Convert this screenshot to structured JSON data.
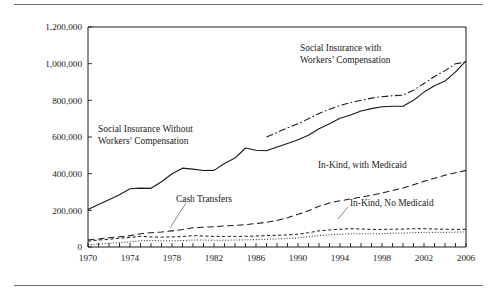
{
  "figure": {
    "has_top_rule": true,
    "has_bottom_rule": true
  },
  "axes": {
    "ylabel": "Dollars (Millions)",
    "xlabel": "Year",
    "ytick_labels": [
      "0",
      "200,000",
      "400,000",
      "600,000",
      "800,000",
      "1,000,000",
      "1,200,000"
    ],
    "xtick_labels": [
      "1970",
      "1974",
      "1978",
      "1982",
      "1986",
      "1990",
      "1994",
      "1998",
      "2002",
      "2006"
    ]
  },
  "annotations": {
    "social_with": "Social Insurance with\nWorkers’ Compensation",
    "social_with_line1": "Social Insurance with",
    "social_with_line2": "Workers’ Compensation",
    "social_without_line1": "Social Insurance Without",
    "social_without_line2": "Workers’ Compensation",
    "inkind_with": "In-Kind, with Medicaid",
    "inkind_no": "In-Kind, No Medicaid",
    "cash_transfers": "Cash Transfers"
  },
  "chart_data": {
    "type": "line",
    "title": "",
    "xlabel": "Year",
    "ylabel": "Dollars (Millions)",
    "xlim": [
      1970,
      2006
    ],
    "ylim": [
      0,
      1200000
    ],
    "ytick_values": [
      0,
      200000,
      400000,
      600000,
      800000,
      1000000,
      1200000
    ],
    "xtick_values": [
      1970,
      1974,
      1978,
      1982,
      1986,
      1990,
      1994,
      1998,
      2002,
      2006
    ],
    "minor_xticks_every": 1,
    "grid": false,
    "legend": "inline-annotations",
    "x": [
      1970,
      1971,
      1972,
      1973,
      1974,
      1975,
      1976,
      1977,
      1978,
      1979,
      1980,
      1981,
      1982,
      1983,
      1984,
      1985,
      1986,
      1987,
      1988,
      1989,
      1990,
      1991,
      1992,
      1993,
      1994,
      1995,
      1996,
      1997,
      1998,
      1999,
      2000,
      2001,
      2002,
      2003,
      2004,
      2005,
      2006
    ],
    "series": [
      {
        "name": "Social Insurance Without Workers' Compensation",
        "style": "solid",
        "values": [
          205000,
          232000,
          258000,
          285000,
          318000,
          321000,
          320000,
          356000,
          400000,
          430000,
          425000,
          417000,
          418000,
          455000,
          485000,
          540000,
          528000,
          525000,
          545000,
          565000,
          585000,
          610000,
          645000,
          672000,
          702000,
          720000,
          742000,
          755000,
          765000,
          768000,
          768000,
          800000,
          845000,
          880000,
          905000,
          955000,
          1015000
        ]
      },
      {
        "name": "Social Insurance with Workers' Compensation",
        "style": "dashdot",
        "start_year": 1987,
        "values": [
          null,
          null,
          null,
          null,
          null,
          null,
          null,
          null,
          null,
          null,
          null,
          null,
          null,
          null,
          null,
          null,
          null,
          600000,
          625000,
          650000,
          672000,
          700000,
          728000,
          752000,
          772000,
          788000,
          800000,
          812000,
          820000,
          825000,
          828000,
          855000,
          892000,
          930000,
          962000,
          1000000,
          1008000
        ]
      },
      {
        "name": "In-Kind, with Medicaid",
        "style": "dashed-long",
        "values": [
          38000,
          44000,
          50000,
          56000,
          62000,
          72000,
          78000,
          82000,
          88000,
          95000,
          105000,
          108000,
          110000,
          115000,
          118000,
          122000,
          128000,
          135000,
          145000,
          160000,
          178000,
          198000,
          222000,
          240000,
          252000,
          262000,
          272000,
          282000,
          295000,
          308000,
          322000,
          340000,
          358000,
          375000,
          392000,
          405000,
          418000
        ]
      },
      {
        "name": "Cash Transfers",
        "style": "dashed-short",
        "values": [
          32000,
          38000,
          42000,
          48000,
          52000,
          58000,
          55000,
          54000,
          55000,
          57000,
          62000,
          60000,
          58000,
          58000,
          58000,
          58000,
          60000,
          62000,
          64000,
          66000,
          70000,
          78000,
          88000,
          93000,
          97000,
          100000,
          98000,
          96000,
          96000,
          97000,
          98000,
          100000,
          100000,
          98000,
          97000,
          96000,
          97000
        ]
      },
      {
        "name": "In-Kind, No Medicaid (dotted)",
        "style": "dotted",
        "values": [
          12000,
          16000,
          20000,
          24000,
          28000,
          34000,
          35000,
          34000,
          34000,
          35000,
          38000,
          38000,
          37000,
          37000,
          38000,
          39000,
          40000,
          42000,
          44000,
          46000,
          50000,
          56000,
          62000,
          66000,
          70000,
          72000,
          72000,
          72000,
          73000,
          75000,
          76000,
          78000,
          80000,
          80000,
          80000,
          81000,
          82000
        ]
      }
    ]
  }
}
